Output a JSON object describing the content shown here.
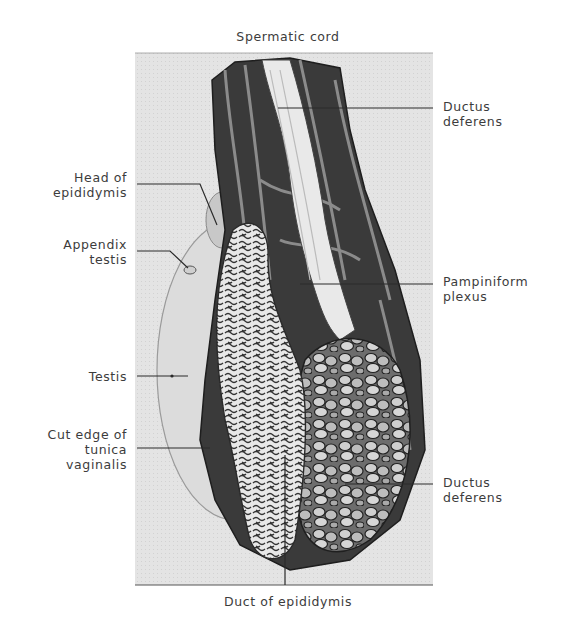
{
  "figure": {
    "top_label": "Spermatic cord",
    "bottom_label": "Duct of epididymis",
    "left_labels": [
      {
        "line1": "Head of",
        "line2": "epididymis"
      },
      {
        "line1": "Appendix",
        "line2": "testis"
      },
      {
        "line1": "Testis",
        "line2": ""
      },
      {
        "line1": "Cut edge of",
        "line2": "tunica",
        "line3": "vaginalis"
      }
    ],
    "right_labels": [
      {
        "line1": "Ductus",
        "line2": "deferens"
      },
      {
        "line1": "Pampiniform",
        "line2": "plexus"
      },
      {
        "line1": "Ductus",
        "line2": "deferens"
      }
    ],
    "colors": {
      "background": "#ffffff",
      "panel": "#e6e6e6",
      "text": "#3c3c3c",
      "leader": "#2a2a2a",
      "dark_tissue": "#2b2b2b",
      "mid_tissue": "#7a7a7a",
      "light_tissue": "#d8d8d8"
    }
  }
}
